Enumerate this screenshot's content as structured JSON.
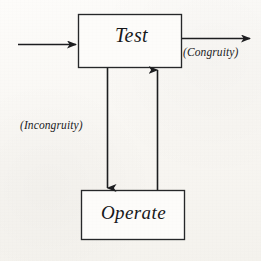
{
  "diagram": {
    "background_color": "#fbfaf7",
    "stroke_color": "#1d1e20",
    "nodes": [
      {
        "id": "test",
        "label": "Test",
        "shape": "rectangle",
        "x": 78,
        "y": 14,
        "width": 104,
        "height": 54
      },
      {
        "id": "operate",
        "label": "Operate",
        "shape": "rectangle",
        "x": 81,
        "y": 190,
        "width": 104,
        "height": 50
      }
    ],
    "edges": [
      {
        "id": "input-edge",
        "label": "",
        "from": "",
        "to": "test",
        "direction": "right",
        "arrowhead": true
      },
      {
        "id": "congruity-edge",
        "label": "(Congruity)",
        "from": "test",
        "to": "",
        "direction": "right",
        "arrowhead": true
      },
      {
        "id": "incongruity-edge",
        "label": "(Incongruity)",
        "from": "test",
        "to": "operate",
        "direction": "down",
        "arrowhead": true
      },
      {
        "id": "return-edge",
        "label": "",
        "from": "operate",
        "to": "test",
        "direction": "up",
        "arrowhead": true
      }
    ]
  }
}
